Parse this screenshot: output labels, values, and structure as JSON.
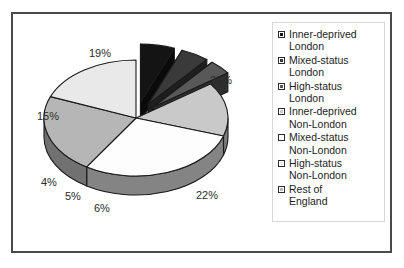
{
  "chart_data": {
    "type": "pie",
    "title": "",
    "subtitle": "",
    "xlabel": "",
    "ylabel": "",
    "legend_position": "right",
    "three_d": true,
    "exploded_slices": [
      "Inner-deprived London",
      "Mixed-status London",
      "High-status London"
    ],
    "categories": [
      "Inner-deprived London",
      "Mixed-status London",
      "High-status London",
      "Inner-deprived Non-London",
      "Mixed-status Non-London",
      "High-status Non-London",
      "Rest of England"
    ],
    "values": [
      6,
      5,
      4,
      15,
      29,
      22,
      19
    ],
    "labels": [
      "6%",
      "5%",
      "4%",
      "15%",
      "29%",
      "22%",
      "19%"
    ],
    "colors": [
      "#141414",
      "#3a3a3a",
      "#585858",
      "#c9c9c9",
      "#fdfdfd",
      "#b6b6b6",
      "#e9e9e9"
    ]
  },
  "legend": {
    "items": [
      {
        "line1": "Inner-deprived",
        "line2": "London",
        "swatch": "#141414"
      },
      {
        "line1": "Mixed-status",
        "line2": "London",
        "swatch": "#3a3a3a"
      },
      {
        "line1": "High-status",
        "line2": "London",
        "swatch": "#585858"
      },
      {
        "line1": "Inner-deprived",
        "line2": "Non-London",
        "swatch": "#c9c9c9"
      },
      {
        "line1": "Mixed-status",
        "line2": "Non-London",
        "swatch": "#fdfdfd"
      },
      {
        "line1": "High-status",
        "line2": "Non-London",
        "swatch": "#e9e9e9"
      },
      {
        "line1": "Rest of",
        "line2": "England",
        "swatch": "#b6b6b6"
      }
    ]
  },
  "percent_labels": {
    "p29": "29%",
    "p22": "22%",
    "p6": "6%",
    "p5": "5%",
    "p4": "4%",
    "p15": "15%",
    "p19": "19%"
  }
}
